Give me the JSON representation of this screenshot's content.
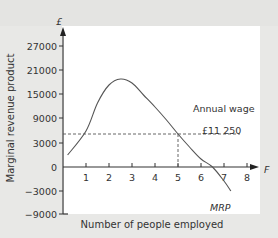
{
  "chart_data": {
    "type": "line",
    "title": "",
    "xlabel": "Number of people employed",
    "ylabel": "Marginal revenue product",
    "y_unit_label": "£",
    "x_unit_label": "F",
    "xlim": [
      0,
      8
    ],
    "ylim": [
      -9000,
      27000
    ],
    "x_ticks": [
      "1",
      "2",
      "3",
      "4",
      "5",
      "6",
      "7",
      "8"
    ],
    "y_ticks": [
      "27000",
      "21000",
      "15000",
      "9000",
      "3000",
      "0",
      "-3000",
      "-9000"
    ],
    "grid": false,
    "series": [
      {
        "name": "MRP",
        "x": [
          0.2,
          1.0,
          1.5,
          2.0,
          2.5,
          3.0,
          3.5,
          4.0,
          4.5,
          5.0,
          5.5,
          6.0,
          6.5,
          7.0,
          7.3
        ],
        "values": [
          3000,
          9000,
          16000,
          20500,
          22000,
          21000,
          18000,
          15000,
          11750,
          8250,
          5000,
          2000,
          0,
          -3500,
          -6000
        ]
      }
    ],
    "reference_lines": [
      {
        "type": "horizontal",
        "y": 8250,
        "label": "Annual wage",
        "sublabel": "£11 250",
        "style": "dashed"
      },
      {
        "type": "vertical",
        "x": 5,
        "style": "dashed"
      }
    ],
    "annotations": [
      "Annual wage",
      "£11 250",
      "MRP"
    ]
  }
}
